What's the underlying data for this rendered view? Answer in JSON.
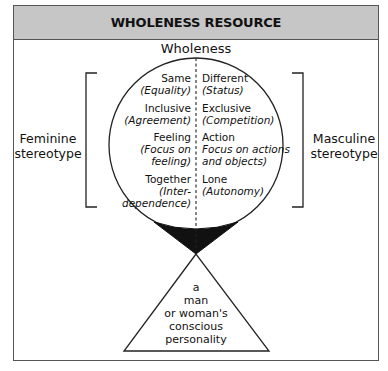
{
  "header": {
    "title": "WHOLENESS RESOURCE"
  },
  "diagram": {
    "title": "Wholeness",
    "left_label": {
      "line1": "Feminine",
      "line2": "stereotype"
    },
    "right_label": {
      "line1": "Masculine",
      "line2": "stereotype"
    },
    "pairs": [
      {
        "left": {
          "term": "Same",
          "note": [
            "(Equality)"
          ]
        },
        "right": {
          "term": "Different",
          "note": [
            "(Status)"
          ]
        }
      },
      {
        "left": {
          "term": "Inclusive",
          "note": [
            "(Agreement)"
          ]
        },
        "right": {
          "term": "Exclusive",
          "note": [
            "(Competition)"
          ]
        }
      },
      {
        "left": {
          "term": "Feeling",
          "note": [
            "(Focus on",
            "feeling)"
          ]
        },
        "right": {
          "term": "Action",
          "note": [
            "Focus on actions",
            "and objects)"
          ]
        }
      },
      {
        "left": {
          "term": "Together",
          "note": [
            "(Inter-",
            "dependence)"
          ]
        },
        "right": {
          "term": "Lone",
          "note": [
            "(Autonomy)"
          ]
        }
      }
    ],
    "triangle_text": [
      "a",
      "man",
      "or woman's",
      "conscious",
      "personality"
    ]
  },
  "colors": {
    "header_bg": "#c6c6c6",
    "border": "#555555",
    "ink": "#111111"
  }
}
